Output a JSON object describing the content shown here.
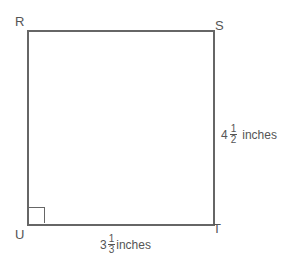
{
  "diagram": {
    "vertices": {
      "R": "R",
      "S": "S",
      "T": "T",
      "U": "U"
    },
    "right_angle_at": "U",
    "side_ST": {
      "whole": "4",
      "numerator": "1",
      "denominator": "2",
      "unit": "inches"
    },
    "side_UT": {
      "whole": "3",
      "numerator": "1",
      "denominator": "3",
      "unit": "inches"
    }
  }
}
